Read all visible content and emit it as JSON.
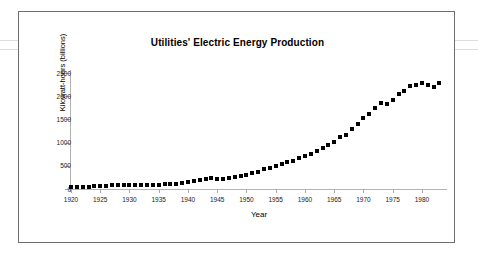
{
  "chart_data": {
    "type": "scatter",
    "title": "Utilities' Electric Energy Production",
    "xlabel": "Year",
    "ylabel": "Kilowatt-hours (billions)",
    "xlim": [
      1920,
      1983.6
    ],
    "ylim": [
      0,
      2500
    ],
    "grid": false,
    "legend": "none",
    "marker": "filled-square",
    "marker_color": "#000000",
    "x_ticks": [
      1920,
      1925,
      1930,
      1935,
      1940,
      1945,
      1950,
      1955,
      1960,
      1965,
      1970,
      1975,
      1980
    ],
    "x_tick_labels": [
      "1920",
      "1925",
      "1930",
      "1935",
      "1940",
      "1945",
      "1950",
      "1955",
      "1960",
      "1965",
      "1970",
      "1975",
      "1980"
    ],
    "y_ticks": [
      0,
      500,
      1000,
      1500,
      2000,
      2500
    ],
    "y_tick_labels": [
      "0",
      "500",
      "1000",
      "1500",
      "2000",
      "2500"
    ],
    "x": [
      1920,
      1921,
      1922,
      1923,
      1924,
      1925,
      1926,
      1927,
      1928,
      1929,
      1930,
      1931,
      1932,
      1933,
      1934,
      1935,
      1936,
      1937,
      1938,
      1939,
      1940,
      1941,
      1942,
      1943,
      1944,
      1945,
      1946,
      1947,
      1948,
      1949,
      1950,
      1951,
      1952,
      1953,
      1954,
      1955,
      1956,
      1957,
      1958,
      1959,
      1960,
      1961,
      1962,
      1963,
      1964,
      1965,
      1966,
      1967,
      1968,
      1969,
      1970,
      1971,
      1972,
      1973,
      1974,
      1975,
      1976,
      1977,
      1978,
      1979,
      1980,
      1981,
      1982,
      1983
    ],
    "values": [
      39,
      38,
      45,
      53,
      58,
      62,
      70,
      76,
      83,
      92,
      91,
      87,
      79,
      80,
      84,
      95,
      108,
      118,
      114,
      128,
      142,
      164,
      186,
      213,
      228,
      222,
      213,
      241,
      262,
      271,
      305,
      348,
      376,
      423,
      442,
      497,
      547,
      580,
      598,
      666,
      719,
      759,
      816,
      880,
      950,
      1015,
      1110,
      1170,
      1290,
      1410,
      1530,
      1610,
      1750,
      1860,
      1830,
      1920,
      2040,
      2120,
      2210,
      2250,
      2290,
      2250,
      2190,
      2280
    ]
  },
  "page": {
    "background": "#ffffff",
    "frame_color": "#6e6e72"
  }
}
